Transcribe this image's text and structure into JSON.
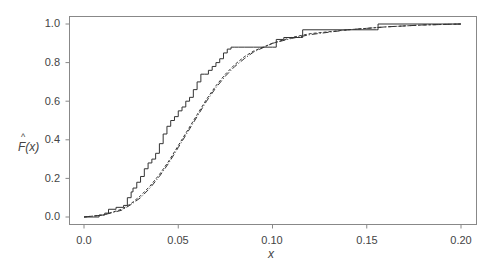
{
  "chart_data": {
    "type": "line",
    "title": "",
    "xlabel": "x",
    "ylabel": "F̂(x)",
    "xlim": [
      -0.008,
      0.208
    ],
    "ylim": [
      -0.04,
      1.04
    ],
    "xticks": [
      "0.00",
      "0.05",
      "0.10",
      "0.15",
      "0.20"
    ],
    "yticks": [
      "0.0",
      "0.2",
      "0.4",
      "0.6",
      "0.8",
      "1.0"
    ],
    "grid": false,
    "legend": null,
    "series": [
      {
        "name": "empirical-cdf",
        "style": "solid-step",
        "x": [
          0.0,
          0.008,
          0.011,
          0.013,
          0.017,
          0.021,
          0.023,
          0.025,
          0.026,
          0.028,
          0.03,
          0.032,
          0.034,
          0.036,
          0.038,
          0.04,
          0.042,
          0.044,
          0.046,
          0.048,
          0.05,
          0.052,
          0.054,
          0.056,
          0.058,
          0.06,
          0.062,
          0.064,
          0.066,
          0.068,
          0.07,
          0.072,
          0.074,
          0.076,
          0.078,
          0.08,
          0.082,
          0.085,
          0.09,
          0.1,
          0.102,
          0.104,
          0.106,
          0.115,
          0.116,
          0.155,
          0.156,
          0.2
        ],
        "y": [
          0.0,
          0.01,
          0.02,
          0.04,
          0.05,
          0.06,
          0.1,
          0.13,
          0.15,
          0.18,
          0.21,
          0.25,
          0.28,
          0.3,
          0.33,
          0.38,
          0.43,
          0.47,
          0.5,
          0.52,
          0.55,
          0.57,
          0.6,
          0.62,
          0.66,
          0.7,
          0.74,
          0.74,
          0.76,
          0.78,
          0.8,
          0.82,
          0.85,
          0.87,
          0.88,
          0.88,
          0.88,
          0.88,
          0.88,
          0.88,
          0.92,
          0.92,
          0.93,
          0.93,
          0.97,
          0.97,
          1.0,
          1.0
        ]
      },
      {
        "name": "fitted-cdf-1",
        "style": "dashed",
        "x": [
          0.0,
          0.01,
          0.02,
          0.025,
          0.03,
          0.035,
          0.04,
          0.045,
          0.05,
          0.055,
          0.06,
          0.065,
          0.07,
          0.075,
          0.08,
          0.085,
          0.09,
          0.1,
          0.11,
          0.12,
          0.14,
          0.16,
          0.18,
          0.2
        ],
        "y": [
          0.0,
          0.01,
          0.04,
          0.07,
          0.11,
          0.16,
          0.22,
          0.29,
          0.37,
          0.45,
          0.53,
          0.61,
          0.68,
          0.74,
          0.79,
          0.83,
          0.86,
          0.9,
          0.93,
          0.95,
          0.97,
          0.985,
          0.995,
          1.0
        ]
      },
      {
        "name": "fitted-cdf-2",
        "style": "dash-dot",
        "x": [
          0.0,
          0.01,
          0.02,
          0.025,
          0.03,
          0.035,
          0.04,
          0.045,
          0.05,
          0.055,
          0.06,
          0.065,
          0.07,
          0.075,
          0.08,
          0.085,
          0.09,
          0.1,
          0.11,
          0.12,
          0.14,
          0.16,
          0.18,
          0.2
        ],
        "y": [
          0.0,
          0.01,
          0.035,
          0.065,
          0.1,
          0.15,
          0.21,
          0.28,
          0.36,
          0.44,
          0.52,
          0.6,
          0.67,
          0.73,
          0.78,
          0.82,
          0.855,
          0.9,
          0.925,
          0.945,
          0.97,
          0.985,
          0.995,
          1.0
        ]
      }
    ]
  },
  "axes": {
    "x_label": "x",
    "y_label_main": "F(x)",
    "y_label_hat": "^",
    "yticks": [
      "0.0",
      "0.2",
      "0.4",
      "0.6",
      "0.8",
      "1.0"
    ],
    "xticks": [
      "0.0",
      "0.05",
      "0.10",
      "0.15",
      "0.20"
    ]
  }
}
